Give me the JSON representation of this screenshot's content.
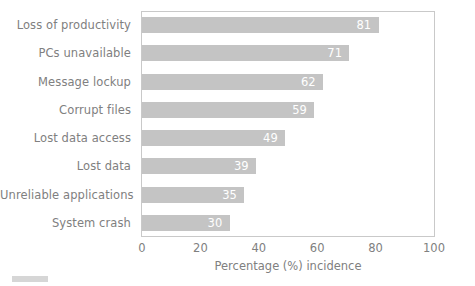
{
  "chart_data": {
    "type": "bar",
    "orientation": "horizontal",
    "title": "",
    "xlabel": "Percentage (%) incidence",
    "ylabel": "",
    "xlim": [
      0,
      100
    ],
    "xticks": [
      "0",
      "20",
      "40",
      "60",
      "80",
      "100"
    ],
    "grid": false,
    "legend": false,
    "bar_color": "#c4c4c4",
    "value_label_color": "#ffffff",
    "axis_text_color": "#808080",
    "categories": [
      "Loss of productivity",
      "PCs unavailable",
      "Message lockup",
      "Corrupt files",
      "Lost data access",
      "Lost data",
      "Unreliable applications",
      "System crash"
    ],
    "values": [
      81,
      71,
      62,
      59,
      49,
      39,
      35,
      30
    ],
    "value_labels": [
      "81",
      "71",
      "62",
      "59",
      "49",
      "39",
      "35",
      "30"
    ]
  },
  "footer": {
    "mark_color": "#d6d6d6"
  }
}
